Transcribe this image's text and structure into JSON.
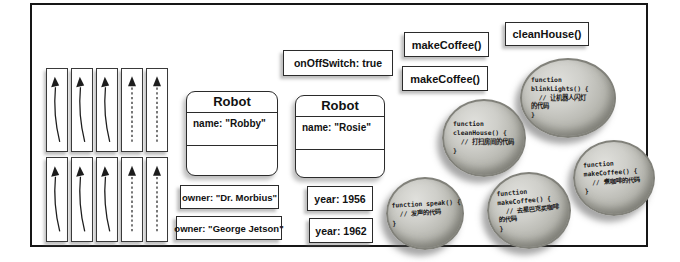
{
  "diagram": {
    "colors": {
      "background": "#ffffff",
      "line": "#1d1d1d",
      "sphere_gray": "#b3b3ac"
    },
    "arrow_grid": {
      "rows": 2,
      "columns": 5,
      "solid_curved_arrow_columns": 3,
      "dashed_arrow_columns": 2
    },
    "classes": [
      {
        "title": "Robot",
        "property": "name: \"Robby\""
      },
      {
        "title": "Robot",
        "property": "name: \"Rosie\""
      }
    ],
    "labels": {
      "on_off_switch": "onOffSwitch: true",
      "make_coffee_top": "makeCoffee()",
      "make_coffee_mid": "makeCoffee()",
      "clean_house": "cleanHouse()",
      "owner_morbius": "owner: \"Dr. Morbius\"",
      "owner_jetson": "owner: \"George Jetson\"",
      "year_1956": "year: 1956",
      "year_1962": "year: 1962"
    },
    "spheres": [
      {
        "method": "blinkLights",
        "code": "function\nblinkLights() {\n  // 让机器人闪灯\n的代码\n}"
      },
      {
        "method": "cleanHouse",
        "code": "function\ncleanHouse() {\n  // 打扫房间的代码\n}"
      },
      {
        "method": "speak",
        "code": "function speak() {\n  // 发声的代码\n}"
      },
      {
        "method": "makeCoffee",
        "code": "function\nmakeCoffee() {\n  // 去星巴克买咖啡\n的代码\n}"
      },
      {
        "method": "makeCoffee",
        "code": "function\nmakeCoffee() {\n  // 煮咖啡的代码\n}"
      }
    ]
  }
}
